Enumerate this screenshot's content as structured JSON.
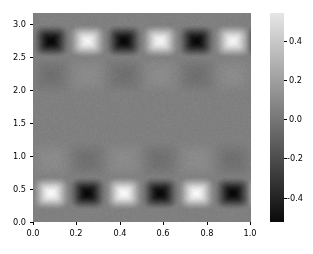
{
  "chart_data": {
    "type": "heatmap",
    "title": "",
    "xlabel": "",
    "ylabel": "",
    "xlim": [
      0.0,
      1.0
    ],
    "ylim": [
      0.0,
      3.2
    ],
    "grid": false,
    "colormap": "gray",
    "x_ticks": [
      "0.0",
      "0.2",
      "0.4",
      "0.6",
      "0.8",
      "1.0"
    ],
    "x_tick_values": [
      0.0,
      0.2,
      0.4,
      0.6,
      0.8,
      1.0
    ],
    "y_ticks": [
      "0.0",
      "0.5",
      "1.0",
      "1.5",
      "2.0",
      "2.5",
      "3.0"
    ],
    "y_tick_values": [
      0.0,
      0.5,
      1.0,
      1.5,
      2.0,
      2.5,
      3.0
    ],
    "background_value": 0.0,
    "vmin": -0.55,
    "vmax": 0.55,
    "colorbar": {
      "position": "right",
      "orientation": "vertical",
      "ticks": [
        "0.4",
        "0.2",
        "0.0",
        "-0.2",
        "-0.4"
      ],
      "tick_values": [
        0.4,
        0.2,
        0.0,
        -0.2,
        -0.4
      ]
    },
    "blobs": [
      {
        "x": 0.083,
        "y": 2.77,
        "value": -0.52
      },
      {
        "x": 0.25,
        "y": 2.77,
        "value": 0.5
      },
      {
        "x": 0.417,
        "y": 2.77,
        "value": -0.52
      },
      {
        "x": 0.583,
        "y": 2.77,
        "value": 0.5
      },
      {
        "x": 0.75,
        "y": 2.77,
        "value": -0.52
      },
      {
        "x": 0.917,
        "y": 2.77,
        "value": 0.5
      },
      {
        "x": 1.06,
        "y": 2.77,
        "value": -0.45
      },
      {
        "x": 0.083,
        "y": 0.44,
        "value": 0.52
      },
      {
        "x": 0.25,
        "y": 0.44,
        "value": -0.52
      },
      {
        "x": 0.417,
        "y": 0.44,
        "value": 0.52
      },
      {
        "x": 0.583,
        "y": 0.44,
        "value": -0.52
      },
      {
        "x": 0.75,
        "y": 0.44,
        "value": 0.52
      },
      {
        "x": 0.917,
        "y": 0.44,
        "value": -0.52
      },
      {
        "x": 1.06,
        "y": 0.44,
        "value": 0.4
      }
    ],
    "faint_blobs": [
      {
        "x": 0.083,
        "y": 2.25,
        "value": -0.07
      },
      {
        "x": 0.25,
        "y": 2.25,
        "value": 0.05
      },
      {
        "x": 0.417,
        "y": 2.25,
        "value": -0.07
      },
      {
        "x": 0.583,
        "y": 2.25,
        "value": 0.05
      },
      {
        "x": 0.75,
        "y": 2.25,
        "value": -0.07
      },
      {
        "x": 0.917,
        "y": 2.25,
        "value": 0.05
      },
      {
        "x": 0.083,
        "y": 0.95,
        "value": 0.05
      },
      {
        "x": 0.25,
        "y": 0.95,
        "value": -0.07
      },
      {
        "x": 0.417,
        "y": 0.95,
        "value": 0.05
      },
      {
        "x": 0.583,
        "y": 0.95,
        "value": -0.07
      },
      {
        "x": 0.75,
        "y": 0.95,
        "value": 0.05
      },
      {
        "x": 0.917,
        "y": 0.95,
        "value": -0.07
      }
    ],
    "colors": {
      "background": "#ffffff",
      "mid_gray": "#808080",
      "dark": "#0a0a0a",
      "light": "#e6e6e6",
      "tick_text": "#000000"
    }
  }
}
